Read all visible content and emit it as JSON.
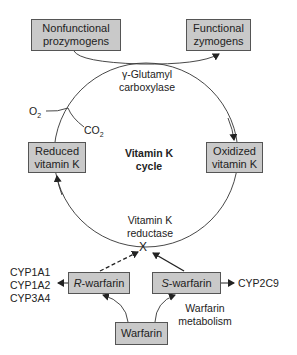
{
  "boxes": {
    "nonfunctional": {
      "line1": "Nonfunctional",
      "line2": "prozymogens"
    },
    "functional": {
      "line1": "Functional",
      "line2": "zymogens"
    },
    "reduced": {
      "line1": "Reduced",
      "line2": "vitamin K"
    },
    "oxidized": {
      "line1": "Oxidized",
      "line2": "vitamin K"
    },
    "r_warfarin": {
      "prefix": "R",
      "suffix": "-warfarin"
    },
    "s_warfarin": {
      "prefix": "S",
      "suffix": "-warfarin"
    },
    "warfarin": {
      "label": "Warfarin"
    }
  },
  "labels": {
    "carboxylase_1": "γ-Glutamyl",
    "carboxylase_2": "carboxylase",
    "cycle_1": "Vitamin K",
    "cycle_2": "cycle",
    "reductase_1": "Vitamin K",
    "reductase_2": "reductase",
    "o2": "O",
    "o2_sub": "2",
    "co2": "CO",
    "co2_sub": "2",
    "cyp_left": [
      "CYP1A1",
      "CYP1A2",
      "CYP3A4"
    ],
    "cyp_right": "CYP2C9",
    "metabolism_1": "Warfarin",
    "metabolism_2": "metabolism",
    "inhibition_mark": "X"
  },
  "colors": {
    "box_fill": "#c9c9c9",
    "line": "#333333"
  }
}
